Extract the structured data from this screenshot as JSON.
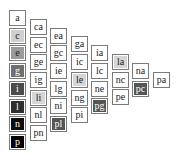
{
  "diagram": {
    "type": "staircase-table",
    "columns": [
      {
        "cells": [
          {
            "label": "a",
            "fill": "#ffffff"
          },
          {
            "label": "c",
            "fill": "#cfcfcf"
          },
          {
            "label": "e",
            "fill": "#9b9b9b"
          },
          {
            "label": "g",
            "fill": "#707070"
          },
          {
            "label": "i",
            "fill": "#4a4a4a"
          },
          {
            "label": "l",
            "fill": "#2e2e2e"
          },
          {
            "label": "n",
            "fill": "#0d0d0d"
          },
          {
            "label": "p",
            "fill": "#000000"
          }
        ]
      },
      {
        "cells": [
          {
            "label": "ca",
            "fill": "#ffffff"
          },
          {
            "label": "ec",
            "fill": "#ffffff"
          },
          {
            "label": "ge",
            "fill": "#ffffff"
          },
          {
            "label": "ig",
            "fill": "#ffffff"
          },
          {
            "label": "li",
            "fill": "#d6d6d6"
          },
          {
            "label": "nl",
            "fill": "#ffffff"
          },
          {
            "label": "pn",
            "fill": "#ffffff"
          }
        ]
      },
      {
        "cells": [
          {
            "label": "ea",
            "fill": "#ffffff"
          },
          {
            "label": "gc",
            "fill": "#ffffff"
          },
          {
            "label": "ie",
            "fill": "#ffffff"
          },
          {
            "label": "lg",
            "fill": "#ffffff"
          },
          {
            "label": "ni",
            "fill": "#ffffff"
          },
          {
            "label": "pl",
            "fill": "#555555"
          }
        ]
      },
      {
        "cells": [
          {
            "label": "ga",
            "fill": "#ffffff"
          },
          {
            "label": "ic",
            "fill": "#ffffff"
          },
          {
            "label": "le",
            "fill": "#d6d6d6"
          },
          {
            "label": "ng",
            "fill": "#ffffff"
          },
          {
            "label": "pi",
            "fill": "#ffffff"
          }
        ]
      },
      {
        "cells": [
          {
            "label": "ia",
            "fill": "#ffffff"
          },
          {
            "label": "lc",
            "fill": "#ffffff"
          },
          {
            "label": "ne",
            "fill": "#ffffff"
          },
          {
            "label": "pg",
            "fill": "#555555"
          }
        ]
      },
      {
        "cells": [
          {
            "label": "la",
            "fill": "#d6d6d6"
          },
          {
            "label": "nc",
            "fill": "#ffffff"
          },
          {
            "label": "pe",
            "fill": "#ffffff"
          }
        ]
      },
      {
        "cells": [
          {
            "label": "na",
            "fill": "#ffffff"
          },
          {
            "label": "pc",
            "fill": "#555555"
          }
        ]
      },
      {
        "cells": [
          {
            "label": "pa",
            "fill": "#ffffff"
          }
        ]
      }
    ]
  }
}
